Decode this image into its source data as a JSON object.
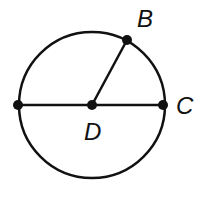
{
  "diagram": {
    "type": "circle-geometry",
    "circle": {
      "center": "D",
      "cx": 92,
      "cy": 105,
      "r": 75
    },
    "points": [
      {
        "name": "A",
        "x": 18,
        "y": 105,
        "label_visible": false
      },
      {
        "name": "B",
        "x": 127,
        "y": 40,
        "label_visible": true
      },
      {
        "name": "C",
        "x": 163,
        "y": 105,
        "label_visible": true
      },
      {
        "name": "D",
        "x": 92,
        "y": 105,
        "label_visible": true
      }
    ],
    "segments": [
      {
        "from": "A",
        "to": "C",
        "kind": "diameter"
      },
      {
        "from": "D",
        "to": "B",
        "kind": "radius"
      }
    ],
    "labels": {
      "B": "B",
      "C": "C",
      "D": "D"
    },
    "colors": {
      "stroke": "#111111",
      "background": "#ffffff"
    }
  }
}
